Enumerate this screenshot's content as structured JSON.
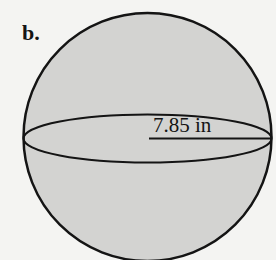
{
  "problem": {
    "label": "b.",
    "figure": "sphere",
    "dimension": {
      "type": "radius",
      "value_text": "7.85 in"
    }
  },
  "colors": {
    "sphere_fill": "#d3d3d1",
    "stroke": "#141414",
    "background": "#f4f4f2"
  }
}
